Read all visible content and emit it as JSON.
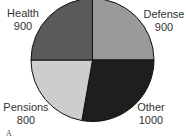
{
  "chart_data": {
    "type": "pie",
    "title": "",
    "figure_label": "A",
    "total": 3600,
    "slices": [
      {
        "label": "Defense",
        "value": 900,
        "color": "#9a9a9a"
      },
      {
        "label": "Other",
        "value": 1000,
        "color": "#1e1e1e"
      },
      {
        "label": "Pensions",
        "value": 800,
        "color": "#cdcdcd"
      },
      {
        "label": "Health",
        "value": 900,
        "color": "#5a5a5a"
      }
    ],
    "start_angle_deg": 0,
    "direction": "clockwise",
    "legend": "none (direct labels outside slices)"
  },
  "labels": {
    "defense": {
      "name": "Defense",
      "value": "900"
    },
    "other": {
      "name": "Other",
      "value": "1000"
    },
    "pensions": {
      "name": "Pensions",
      "value": "800"
    },
    "health": {
      "name": "Health",
      "value": "900"
    }
  },
  "figure_label": "A"
}
